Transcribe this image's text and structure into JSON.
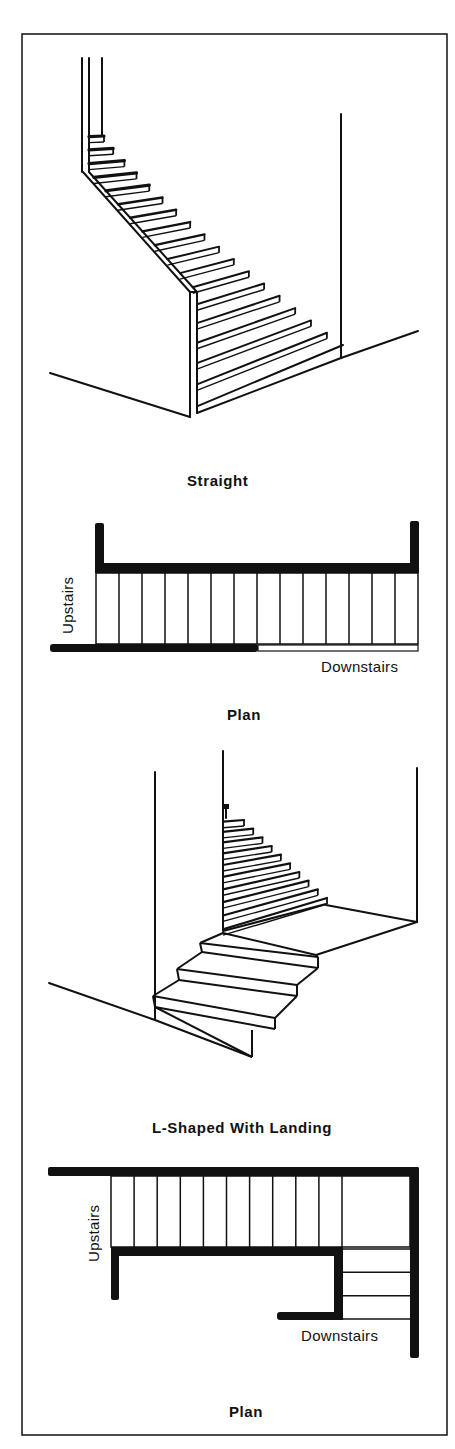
{
  "figure": {
    "frame": {
      "border_color": "#111111",
      "background": "#ffffff"
    },
    "sections": [
      {
        "id": "straight",
        "caption": "Straight",
        "perspective_steps": 18,
        "plan": {
          "caption": "Plan",
          "upstairs_label": "Upstairs",
          "downstairs_label": "Downstairs",
          "tread_count": 14
        }
      },
      {
        "id": "l-shaped",
        "caption": "L-Shaped With Landing",
        "perspective_upper_steps": 10,
        "perspective_lower_steps": 3,
        "plan": {
          "caption": "Plan",
          "upstairs_label": "Upstairs",
          "downstairs_label": "Downstairs",
          "upper_tread_count": 10,
          "lower_tread_count": 3
        }
      }
    ]
  }
}
